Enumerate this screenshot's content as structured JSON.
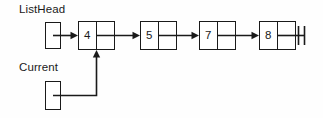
{
  "diagram": {
    "title_labels": {
      "listhead": "ListHead",
      "current": "Current"
    },
    "nodes": [
      {
        "value": "4"
      },
      {
        "value": "5"
      },
      {
        "value": "7"
      },
      {
        "value": "8"
      }
    ],
    "terminator": {
      "name": "null-terminator",
      "symbol": "ground-double-bar"
    },
    "pointers": [
      {
        "name": "ListHead",
        "target_node_value": "4"
      },
      {
        "name": "Current",
        "target_node_value": "4"
      }
    ],
    "colors": {
      "ink": "#1a1a1a",
      "background": "#fefefe",
      "node_fill": "#ffffff"
    }
  }
}
